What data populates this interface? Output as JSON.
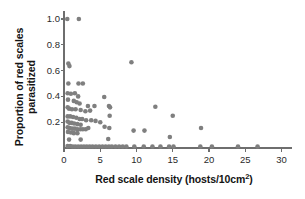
{
  "figure": {
    "background": "#ffffff",
    "marker_color": "#7f7f7f",
    "axis_color": "#6e6e6e",
    "text_color": "#141414"
  },
  "labels": {
    "ylabel_line1": "Proportion of red scales",
    "ylabel_line2": "parasitized",
    "xlabel_main": "Red scale density (hosts/10cm",
    "xlabel_sup": "2",
    "xlabel_close": ")"
  },
  "caption": {
    "fragment": ""
  },
  "chart_data": {
    "type": "scatter",
    "title": "",
    "xlabel": "Red scale density (hosts/10cm2)",
    "ylabel": "Proportion of red scales parasitized",
    "xlim": [
      -0.55,
      31.5
    ],
    "ylim": [
      -0.04,
      1.06
    ],
    "xticks": [
      0,
      5,
      10,
      15,
      20,
      25,
      30
    ],
    "xtick_labels": [
      "0",
      "5",
      "10",
      "15",
      "20",
      "25",
      "30"
    ],
    "yticks": [
      0.2,
      0.4,
      0.6,
      0.8,
      1.0
    ],
    "ytick_labels": [
      "0.2",
      "0.4",
      "0.6",
      "0.8",
      "1.0"
    ],
    "grid": false,
    "legend": null,
    "marker": {
      "shape": "circle",
      "size_px": 4.6,
      "color": "#7f7f7f"
    },
    "points": [
      [
        0.45,
        1.0
      ],
      [
        2.05,
        1.0
      ],
      [
        0.6,
        0.655
      ],
      [
        0.75,
        0.635
      ],
      [
        9.3,
        0.665
      ],
      [
        0.6,
        0.5
      ],
      [
        2.0,
        0.5
      ],
      [
        2.6,
        0.5
      ],
      [
        0.5,
        0.425
      ],
      [
        0.95,
        0.42
      ],
      [
        1.5,
        0.425
      ],
      [
        1.95,
        0.4
      ],
      [
        5.55,
        0.395
      ],
      [
        0.55,
        0.375
      ],
      [
        1.35,
        0.365
      ],
      [
        1.75,
        0.355
      ],
      [
        2.15,
        0.345
      ],
      [
        3.3,
        0.325
      ],
      [
        4.2,
        0.325
      ],
      [
        6.2,
        0.325
      ],
      [
        6.35,
        0.315
      ],
      [
        12.6,
        0.32
      ],
      [
        0.5,
        0.315
      ],
      [
        0.7,
        0.305
      ],
      [
        1.1,
        0.3
      ],
      [
        1.6,
        0.3
      ],
      [
        2.3,
        0.295
      ],
      [
        2.95,
        0.285
      ],
      [
        3.6,
        0.29
      ],
      [
        15.0,
        0.25
      ],
      [
        6.3,
        0.25
      ],
      [
        0.5,
        0.245
      ],
      [
        0.85,
        0.245
      ],
      [
        1.25,
        0.24
      ],
      [
        1.7,
        0.235
      ],
      [
        2.15,
        0.225
      ],
      [
        2.5,
        0.225
      ],
      [
        3.05,
        0.215
      ],
      [
        3.75,
        0.215
      ],
      [
        4.35,
        0.21
      ],
      [
        5.0,
        0.2
      ],
      [
        0.5,
        0.205
      ],
      [
        0.75,
        0.195
      ],
      [
        1.05,
        0.195
      ],
      [
        1.4,
        0.19
      ],
      [
        1.85,
        0.185
      ],
      [
        2.3,
        0.18
      ],
      [
        5.6,
        0.165
      ],
      [
        6.25,
        0.155
      ],
      [
        3.35,
        0.155
      ],
      [
        0.5,
        0.16
      ],
      [
        0.8,
        0.155
      ],
      [
        1.15,
        0.15
      ],
      [
        1.5,
        0.15
      ],
      [
        1.85,
        0.145
      ],
      [
        2.25,
        0.145
      ],
      [
        2.6,
        0.145
      ],
      [
        3.0,
        0.145
      ],
      [
        18.9,
        0.155
      ],
      [
        9.6,
        0.135
      ],
      [
        11.1,
        0.135
      ],
      [
        0.55,
        0.125
      ],
      [
        0.95,
        0.12
      ],
      [
        1.35,
        0.115
      ],
      [
        1.85,
        0.115
      ],
      [
        14.6,
        0.085
      ],
      [
        0.7,
        0.065
      ],
      [
        2.3,
        0.065
      ],
      [
        6.1,
        0.07
      ],
      [
        0.5,
        0.015
      ],
      [
        0.85,
        0.015
      ],
      [
        1.2,
        0.012
      ],
      [
        1.55,
        0.012
      ],
      [
        1.95,
        0.012
      ],
      [
        2.35,
        0.012
      ],
      [
        2.75,
        0.012
      ],
      [
        3.15,
        0.012
      ],
      [
        3.55,
        0.012
      ],
      [
        3.95,
        0.012
      ],
      [
        4.4,
        0.012
      ],
      [
        4.85,
        0.012
      ],
      [
        5.3,
        0.012
      ],
      [
        5.75,
        0.012
      ],
      [
        6.2,
        0.012
      ],
      [
        6.6,
        0.012
      ],
      [
        7.1,
        0.012
      ],
      [
        7.6,
        0.012
      ],
      [
        8.1,
        0.012
      ],
      [
        8.6,
        0.012
      ],
      [
        9.7,
        0.012
      ],
      [
        11.0,
        0.012
      ],
      [
        12.2,
        0.012
      ],
      [
        13.3,
        0.012
      ],
      [
        14.5,
        0.012
      ],
      [
        15.1,
        0.012
      ],
      [
        18.8,
        0.012
      ],
      [
        20.4,
        0.012
      ],
      [
        24.0,
        0.012
      ],
      [
        26.7,
        0.012
      ]
    ]
  }
}
